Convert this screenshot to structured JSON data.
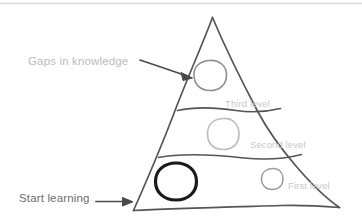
{
  "diagram": {
    "type": "hand-drawn-pyramid",
    "title_bar_divider": true,
    "background_color": "#ffffff",
    "annotations": [
      {
        "id": "gaps",
        "text": "Gaps in knowledge",
        "color": "#bcbcbc",
        "arrow": "diagonal-down-right",
        "points_to": "third-level-circle"
      },
      {
        "id": "start",
        "text": "Start learning",
        "color": "#6d6d6d",
        "arrow": "horizontal-right",
        "points_to": "pyramid-base-left-corner"
      }
    ],
    "levels": [
      {
        "id": "third",
        "label": "Third level",
        "color": "#c9c9c9",
        "order": 3
      },
      {
        "id": "second",
        "label": "Second level",
        "color": "#c9c9c9",
        "order": 2
      },
      {
        "id": "first",
        "label": "First level",
        "color": "#c9c9c9",
        "order": 1
      }
    ],
    "circles": [
      {
        "id": "third-level-circle",
        "level": "third",
        "style": "outline-gray",
        "color": "#8f8f8f",
        "stroke_width": 1.6,
        "size": "medium"
      },
      {
        "id": "second-level-circle",
        "level": "second",
        "style": "outline-light-gray",
        "color": "#bdbdbd",
        "stroke_width": 1.6,
        "size": "medium"
      },
      {
        "id": "first-level-circle-small",
        "level": "first",
        "style": "outline-gray",
        "color": "#9a9a9a",
        "stroke_width": 1.4,
        "size": "small"
      },
      {
        "id": "first-level-circle-bold",
        "level": "first",
        "style": "outline-black-bold",
        "color": "#1a1a1a",
        "stroke_width": 3.2,
        "size": "large"
      }
    ],
    "colors": {
      "outline": "#555555",
      "divider": "#555555",
      "top_rule": "#d8d8d8",
      "arrow": "#4a4a4a",
      "text_light": "#bcbcbc",
      "text_dark": "#6d6d6d",
      "text_level": "#c9c9c9"
    }
  }
}
